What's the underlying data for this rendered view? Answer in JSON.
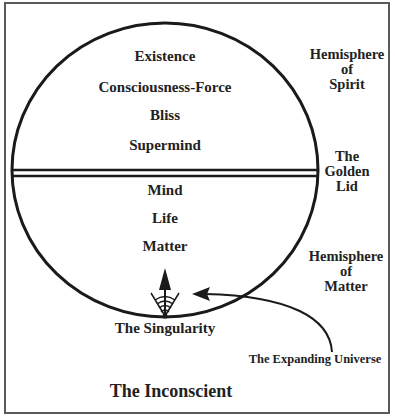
{
  "diagram": {
    "spirit_levels": [
      "Existence",
      "Consciousness-Force",
      "Bliss",
      "Supermind"
    ],
    "matter_levels": [
      "Mind",
      "Life",
      "Matter"
    ],
    "side_labels": {
      "hemisphere_spirit": [
        "Hemisphere",
        "of",
        "Spirit"
      ],
      "golden_lid": [
        "The",
        "Golden",
        "Lid"
      ],
      "hemisphere_matter": [
        "Hemisphere",
        "of",
        "Matter"
      ]
    },
    "singularity_label": "The Singularity",
    "expanding_universe_label": "The Expanding Universe",
    "inconscient_label": "The Inconscient",
    "colors": {
      "line": "#1a1a1a",
      "frame": "#5a5a5a",
      "background": "#ffffff"
    }
  }
}
